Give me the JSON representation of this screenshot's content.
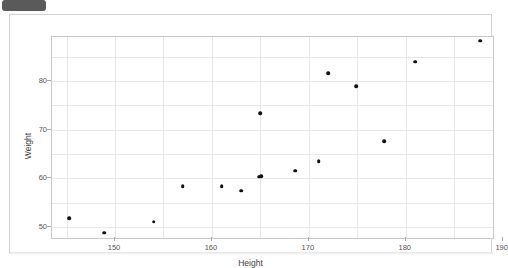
{
  "window": {
    "badge_label": ""
  },
  "chart_data": {
    "type": "scatter",
    "title": "",
    "xlabel": "Height",
    "ylabel": "Weight",
    "xlim": [
      143.5,
      189.0
    ],
    "ylim": [
      47.8,
      89.0
    ],
    "xticks": [
      150,
      160,
      170,
      180,
      190
    ],
    "yticks": [
      50,
      60,
      70,
      80
    ],
    "x_minor_gridlines": [
      145,
      155,
      165,
      175,
      185
    ],
    "y_minor_gridlines": [
      55,
      65,
      75,
      85
    ],
    "grid": true,
    "legend": "none",
    "marker_color": "#111111",
    "grid_color": "#e8e8e8",
    "axis_color": "#c8c8c8",
    "point_count": 16,
    "points": [
      {
        "x": 145.3,
        "y": 51.9
      },
      {
        "x": 148.9,
        "y": 48.9
      },
      {
        "x": 154.0,
        "y": 51.1
      },
      {
        "x": 157.0,
        "y": 58.4
      },
      {
        "x": 161.0,
        "y": 58.4
      },
      {
        "x": 163.0,
        "y": 57.5
      },
      {
        "x": 165.0,
        "y": 73.4
      },
      {
        "x": 165.1,
        "y": 60.5
      },
      {
        "x": 168.6,
        "y": 61.6
      },
      {
        "x": 171.0,
        "y": 63.6
      },
      {
        "x": 172.0,
        "y": 81.6
      },
      {
        "x": 174.9,
        "y": 78.9
      },
      {
        "x": 177.8,
        "y": 67.6
      },
      {
        "x": 181.0,
        "y": 83.9
      },
      {
        "x": 187.7,
        "y": 88.2
      },
      {
        "x": 164.9,
        "y": 60.4
      }
    ],
    "series_name": "Height vs Weight"
  }
}
